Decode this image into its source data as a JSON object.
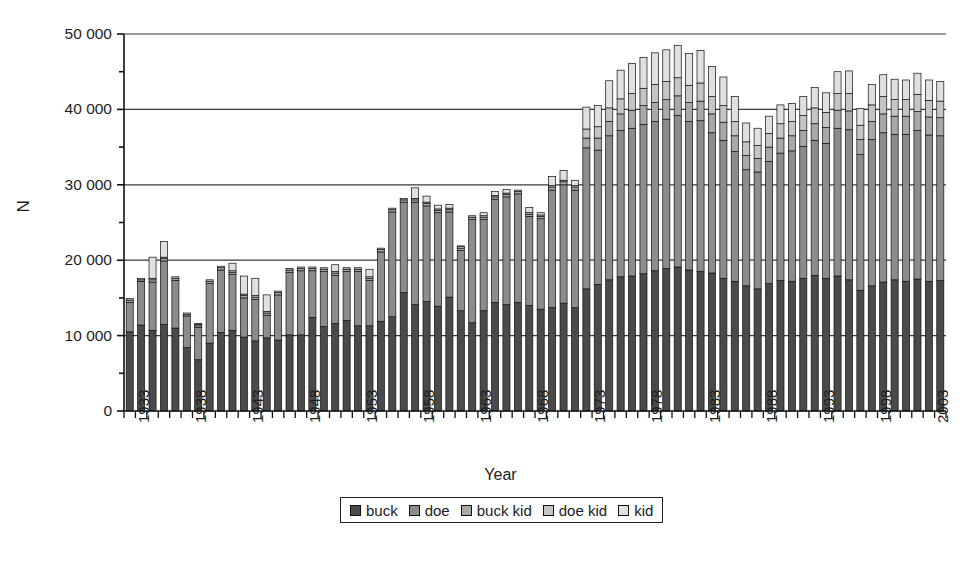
{
  "chart_data": {
    "type": "bar",
    "subtype": "stacked",
    "title": "",
    "xlabel": "Year",
    "ylabel": "N",
    "ylim": [
      0,
      50000
    ],
    "ytick_values": [
      0,
      10000,
      20000,
      30000,
      40000,
      50000
    ],
    "ytick_labels": [
      "0",
      "10 000",
      "20 000",
      "30 000",
      "40 000",
      "50 000"
    ],
    "yminor_values": [
      5000,
      15000,
      25000,
      35000,
      45000
    ],
    "grid": "horizontal-major",
    "legend_position": "bottom-center",
    "xtick_labels": [
      "1933",
      "1938",
      "1943",
      "1948",
      "1953",
      "1958",
      "1963",
      "1968",
      "1973",
      "1978",
      "1983",
      "1988",
      "1993",
      "1998",
      "2003"
    ],
    "xtick_step": 5,
    "x_start": 1933,
    "x_end": 2004,
    "categories": [
      1933,
      1934,
      1935,
      1936,
      1937,
      1938,
      1939,
      1940,
      1941,
      1942,
      1943,
      1944,
      1945,
      1946,
      1947,
      1948,
      1949,
      1950,
      1951,
      1952,
      1953,
      1954,
      1955,
      1956,
      1957,
      1958,
      1959,
      1960,
      1961,
      1962,
      1963,
      1964,
      1965,
      1966,
      1967,
      1968,
      1969,
      1970,
      1971,
      1972,
      1973,
      1974,
      1975,
      1976,
      1977,
      1978,
      1979,
      1980,
      1981,
      1982,
      1983,
      1984,
      1985,
      1986,
      1987,
      1988,
      1989,
      1990,
      1991,
      1992,
      1993,
      1994,
      1995,
      1996,
      1997,
      1998,
      1999,
      2000,
      2001,
      2002,
      2003,
      2004
    ],
    "series": [
      {
        "name": "buck",
        "color": "#4a4a4a",
        "values": [
          10500,
          11400,
          10700,
          11500,
          11000,
          8400,
          6800,
          9000,
          10400,
          10700,
          9800,
          9300,
          9700,
          9400,
          10100,
          10100,
          12400,
          11200,
          11600,
          12000,
          11300,
          11300,
          11900,
          12500,
          15700,
          14100,
          14500,
          13900,
          15100,
          13300,
          11700,
          13300,
          14400,
          14100,
          14400,
          14000,
          13500,
          13700,
          14300,
          13700,
          16200,
          16800,
          17400,
          17800,
          17900,
          18200,
          18600,
          18900,
          19100,
          18700,
          18500,
          18300,
          17600,
          17200,
          16600,
          16200,
          16900,
          17300,
          17200,
          17600,
          18000,
          17600,
          17900,
          17400,
          16000,
          16600,
          17100,
          17400,
          17200,
          17500,
          17200,
          17300
        ]
      },
      {
        "name": "doe",
        "color": "#8c8c8c",
        "values": [
          3900,
          5800,
          6400,
          8400,
          6300,
          4200,
          4300,
          7900,
          8300,
          7400,
          5200,
          5500,
          3000,
          6000,
          8300,
          8500,
          6200,
          7300,
          6400,
          6500,
          7200,
          6000,
          9200,
          13900,
          12000,
          13600,
          12700,
          12400,
          11300,
          8000,
          13700,
          12100,
          13700,
          14300,
          14400,
          11800,
          12000,
          15600,
          15700,
          15600,
          18700,
          17800,
          19100,
          19400,
          19600,
          19800,
          19800,
          19800,
          20100,
          19700,
          20000,
          18600,
          18300,
          17200,
          15400,
          15500,
          16200,
          16900,
          17300,
          17500,
          17900,
          17900,
          19600,
          19900,
          18000,
          19400,
          19800,
          19300,
          19500,
          19700,
          19400,
          19200
        ]
      },
      {
        "name": "buck kid",
        "color": "#a8a8a8",
        "values": [
          300,
          200,
          300,
          300,
          300,
          200,
          200,
          300,
          300,
          300,
          300,
          300,
          300,
          300,
          300,
          300,
          300,
          300,
          300,
          300,
          300,
          300,
          300,
          300,
          300,
          300,
          300,
          300,
          300,
          300,
          300,
          300,
          300,
          300,
          300,
          300,
          300,
          400,
          400,
          400,
          1300,
          1600,
          1900,
          2200,
          2400,
          2500,
          2500,
          2600,
          2600,
          2500,
          2600,
          2500,
          2400,
          2100,
          1900,
          1800,
          1900,
          2000,
          2000,
          2100,
          2200,
          2100,
          2400,
          2500,
          2000,
          2400,
          2500,
          2400,
          2400,
          2500,
          2400,
          2400
        ]
      },
      {
        "name": "doe kid",
        "color": "#c5c5c5",
        "values": [
          200,
          200,
          200,
          200,
          200,
          200,
          200,
          200,
          200,
          200,
          200,
          200,
          200,
          200,
          200,
          200,
          200,
          200,
          200,
          200,
          200,
          200,
          200,
          200,
          200,
          200,
          200,
          200,
          200,
          200,
          200,
          200,
          200,
          200,
          200,
          200,
          200,
          200,
          200,
          200,
          1200,
          1500,
          1800,
          2000,
          2200,
          2300,
          2400,
          2400,
          2400,
          2300,
          2400,
          2300,
          2200,
          1900,
          1800,
          1700,
          1800,
          1900,
          1900,
          2000,
          2100,
          2000,
          2200,
          2300,
          1900,
          2200,
          2300,
          2200,
          2200,
          2300,
          2200,
          2200
        ]
      },
      {
        "name": "kid",
        "color": "#e0e0e0",
        "values": [
          0,
          0,
          2800,
          2100,
          0,
          0,
          100,
          0,
          0,
          1000,
          2400,
          2300,
          2200,
          0,
          0,
          0,
          0,
          0,
          900,
          0,
          0,
          1000,
          0,
          0,
          0,
          1400,
          800,
          500,
          500,
          100,
          0,
          400,
          500,
          500,
          0,
          700,
          300,
          1200,
          1300,
          700,
          2900,
          2800,
          3600,
          3800,
          4000,
          4100,
          4200,
          4200,
          4300,
          4200,
          4300,
          4000,
          3800,
          3300,
          2500,
          2300,
          2300,
          2500,
          2400,
          2500,
          2700,
          2600,
          2900,
          3000,
          2200,
          2700,
          2900,
          2700,
          2600,
          2800,
          2700,
          2600
        ]
      }
    ]
  },
  "plot": {
    "left_px": 124,
    "right_px": 946,
    "top_px": 34,
    "bottom_px": 411
  },
  "legend": {
    "items": [
      {
        "label": "buck",
        "color": "#4a4a4a"
      },
      {
        "label": "doe",
        "color": "#8c8c8c"
      },
      {
        "label": "buck kid",
        "color": "#a8a8a8"
      },
      {
        "label": "doe kid",
        "color": "#c5c5c5"
      },
      {
        "label": "kid",
        "color": "#e0e0e0"
      }
    ]
  }
}
